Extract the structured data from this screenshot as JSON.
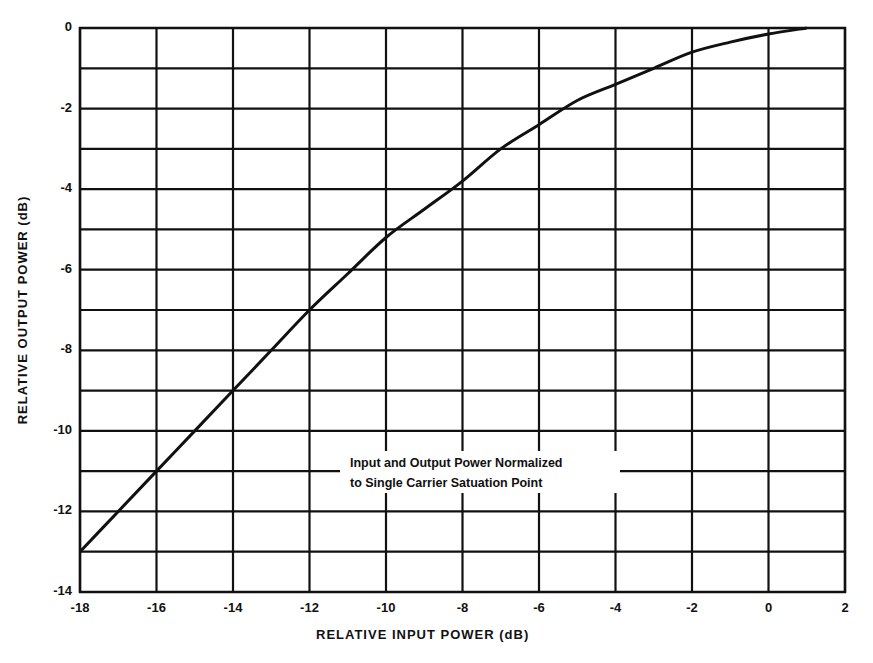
{
  "chart_data": {
    "type": "line",
    "title": "",
    "xlabel": "RELATIVE INPUT POWER (dB)",
    "ylabel": "RELATIVE OUTPUT POWER (dB)",
    "xlim": [
      -18,
      2
    ],
    "ylim": [
      -14,
      0
    ],
    "x_ticks": [
      -18,
      -16,
      -14,
      -12,
      -10,
      -8,
      -6,
      -4,
      -2,
      0,
      2
    ],
    "x_tick_labels": [
      "-18",
      "-16",
      "-14",
      "-12",
      "-10",
      "-8",
      "-6",
      "-4",
      "-2",
      "0",
      "2"
    ],
    "y_ticks": [
      0,
      -2,
      -4,
      -6,
      -8,
      -10,
      -12,
      -14
    ],
    "y_tick_labels": [
      "0",
      "-2",
      "-4",
      "-6",
      "-8",
      "-10",
      "-12",
      "-14"
    ],
    "grid": true,
    "grid_x_step": 2,
    "grid_y_step": 1,
    "legend": null,
    "annotations": [
      {
        "text": "Input and Output Power Normalized",
        "line": 1
      },
      {
        "text": "to Single Carrier Satuation Point",
        "line": 2
      }
    ],
    "series": [
      {
        "name": "Output vs Input Power",
        "x": [
          -18,
          -17,
          -16,
          -15,
          -14,
          -13,
          -12,
          -11,
          -10,
          -9,
          -8,
          -7,
          -6,
          -5,
          -4,
          -3,
          -2,
          -1,
          0,
          1
        ],
        "y": [
          -13,
          -12,
          -11,
          -10,
          -9,
          -8,
          -7,
          -6.1,
          -5.2,
          -4.5,
          -3.8,
          -3.0,
          -2.4,
          -1.8,
          -1.4,
          -1.0,
          -0.6,
          -0.35,
          -0.15,
          0
        ]
      }
    ]
  },
  "labels": {
    "xlabel": "RELATIVE INPUT POWER (dB)",
    "ylabel": "RELATIVE OUTPUT POWER (dB)",
    "note_line1": "Input and Output Power Normalized",
    "note_line2": "to Single Carrier Satuation Point"
  },
  "colors": {
    "line": "#111111",
    "grid": "#111111",
    "background": "#ffffff"
  }
}
